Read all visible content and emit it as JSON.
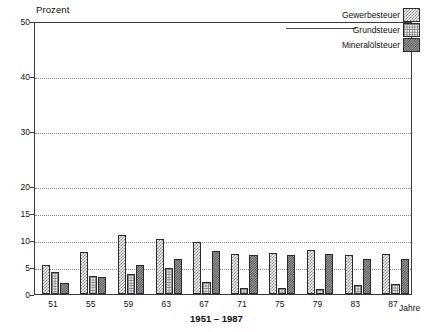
{
  "chart_data": {
    "type": "bar",
    "title": "",
    "ylabel": "Prozent",
    "xlabel": "1951 – 1987",
    "x_axis_end_label": "Jahre",
    "categories": [
      "51",
      "55",
      "59",
      "63",
      "67",
      "71",
      "75",
      "79",
      "83",
      "87"
    ],
    "yticks": [
      0,
      5,
      10,
      15,
      20,
      30,
      40,
      50
    ],
    "ylim": [
      0,
      50
    ],
    "grid": true,
    "legend_position": "top-right",
    "series": [
      {
        "name": "Gewerbesteuer",
        "pattern": "checkerboard",
        "values": [
          5.3,
          7.7,
          11.0,
          10.2,
          9.6,
          7.5,
          7.6,
          8.2,
          7.2,
          7.5
        ]
      },
      {
        "name": "Grundsteuer",
        "pattern": "fine-grid",
        "values": [
          4.1,
          3.3,
          3.7,
          4.8,
          2.3,
          1.2,
          1.2,
          1.0,
          1.6,
          1.9
        ]
      },
      {
        "name": "Mineralölsteuer",
        "pattern": "dense-stipple",
        "values": [
          2.1,
          3.2,
          5.4,
          6.5,
          8.0,
          7.3,
          7.3,
          7.5,
          6.4,
          6.4
        ]
      }
    ]
  },
  "axis": {
    "y_title": "Prozent",
    "x_title": "1951 – 1987",
    "x_end": "Jahre",
    "y_labels": [
      "50",
      "40",
      "30",
      "20",
      "15",
      "10",
      "5",
      "0"
    ],
    "x_labels": [
      "51",
      "55",
      "59",
      "63",
      "67",
      "71",
      "75",
      "79",
      "83",
      "87"
    ]
  },
  "legend": {
    "items": [
      {
        "label": "Gewerbesteuer"
      },
      {
        "label": "Grundsteuer"
      },
      {
        "label": "Mineralölsteuer"
      }
    ]
  }
}
